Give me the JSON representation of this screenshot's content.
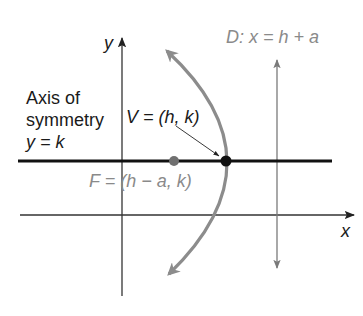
{
  "diagram": {
    "axes": {
      "x_label": "x",
      "y_label": "y"
    },
    "axis_of_symmetry": {
      "line1": "Axis of",
      "line2": "symmetry",
      "equation": "y = k"
    },
    "vertex": {
      "label": "V = (h, k)"
    },
    "focus": {
      "label": "F = (h − a, k)"
    },
    "directrix": {
      "label": "D: x = h + a"
    },
    "colors": {
      "black": "#111111",
      "parabola_gray": "#8c8c8c",
      "text_gray": "#8a8a8a",
      "focus_gray": "#707070",
      "axis_line": "#333333"
    }
  }
}
